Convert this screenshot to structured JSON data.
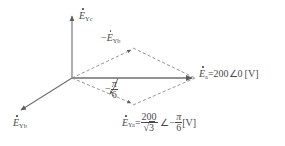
{
  "figure": {
    "type": "phasor-diagram",
    "title": "",
    "background_color": "#ffffff",
    "stroke_color": "#6e6e6e",
    "text_color": "#4a4a4a"
  },
  "axes": {
    "vertical": {
      "name": "E-Yc-axis",
      "label_E": "E",
      "label_sub": "Yc",
      "direction": "up"
    },
    "lower_left": {
      "name": "E-Yb-axis",
      "label_E": "E",
      "label_sub": "Yb",
      "direction": "down-left"
    },
    "horizontal": {
      "name": "E-a-axis",
      "direction": "right"
    }
  },
  "vectors": {
    "Ea": {
      "label_E": "E",
      "label_sub": "a",
      "equals": "=",
      "magnitude": "200",
      "angle_symbol": "∠",
      "angle": "0",
      "unit": "[V]",
      "full_text": "Ėa=200∠0 [V]",
      "style": "solid"
    },
    "negEYb": {
      "sign": "−",
      "label_E": "E",
      "label_sub": "Yb",
      "full_text": "−ĖYb",
      "style": "dashed"
    },
    "EYa": {
      "label_E": "E",
      "label_sub": "Ya",
      "equals": "=",
      "numerator": "200",
      "denominator_radical": "√",
      "denominator": "3",
      "angle_symbol": "∠",
      "angle_sign": "−",
      "angle_numerator": "π",
      "angle_denominator": "6",
      "unit": "[V]",
      "full_text": "ĖYa=200/√3 ∠ −π/6 [V]",
      "style": "dashed"
    }
  },
  "annotations": {
    "angle_arc": {
      "sign": "−",
      "numerator": "π",
      "denominator": "6",
      "full_text": "−π/6"
    }
  }
}
